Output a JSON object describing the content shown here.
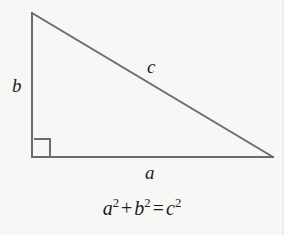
{
  "figure": {
    "name": "right-triangle-pythagorean",
    "background_color": "#f7f7f5",
    "stroke_color": "#6b6b6b",
    "stroke_width": 2,
    "text_color": "#1c1c1c"
  },
  "triangle": {
    "vertices": {
      "apex": {
        "x": 32,
        "y": 13
      },
      "bottom_left": {
        "x": 32,
        "y": 157
      },
      "bottom_right": {
        "x": 273,
        "y": 157
      }
    },
    "right_angle_marker": {
      "corner": "bottom-left",
      "size": 18
    }
  },
  "labels": {
    "vertical_leg": "b",
    "hypotenuse": "c",
    "horizontal_leg": "a"
  },
  "equation": {
    "base_a": "a",
    "exp_a": "2",
    "plus": "+",
    "base_b": "b",
    "exp_b": "2",
    "equals": "=",
    "base_c": "c",
    "exp_c": "2",
    "plain_text": "a² + b² = c²"
  }
}
